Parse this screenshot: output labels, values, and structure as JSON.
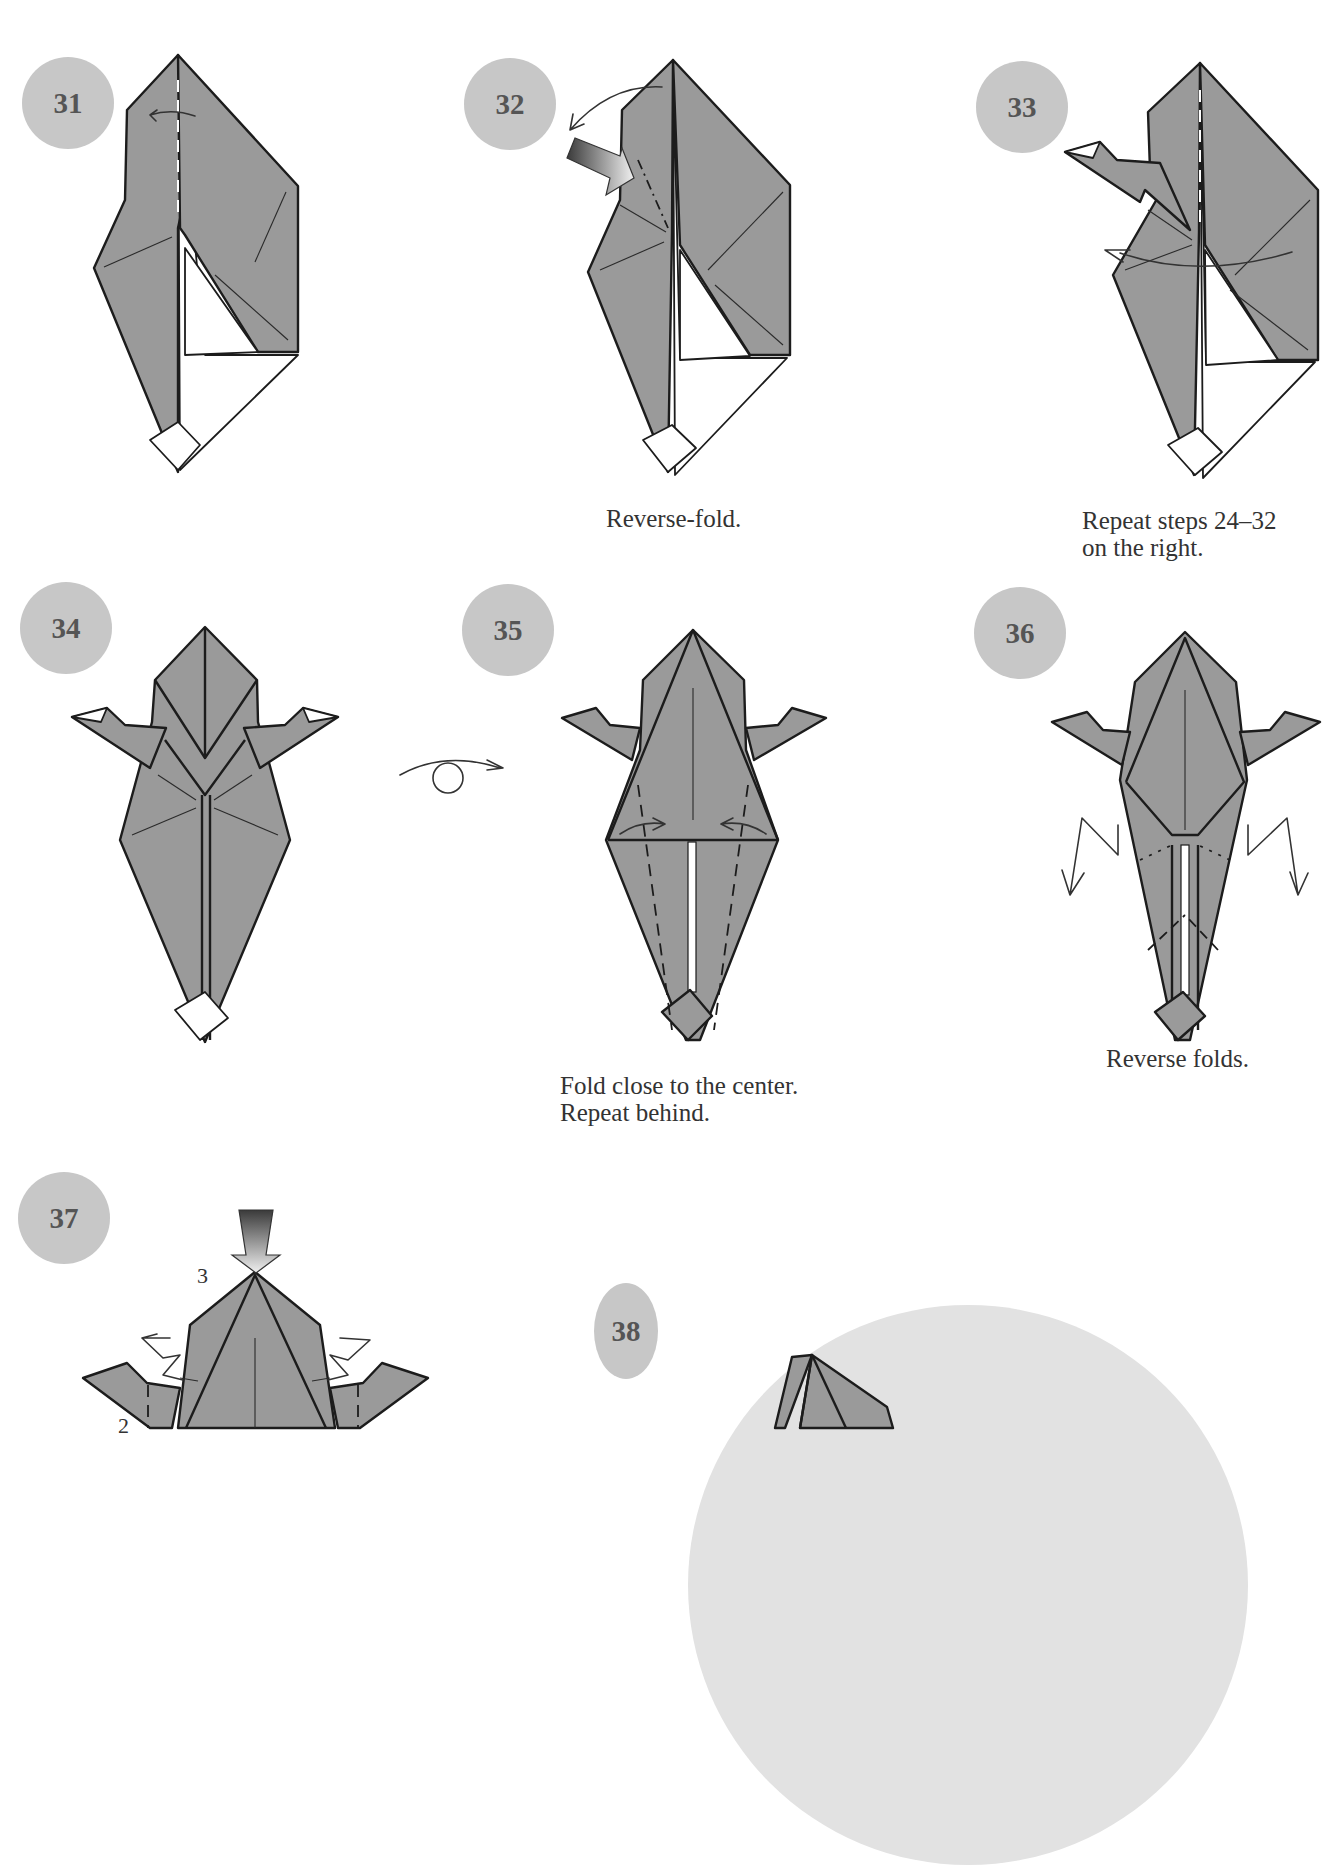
{
  "page": {
    "background": "#ffffff",
    "badge_color": "#c7c7c7",
    "badge_text_color": "#555555",
    "paper_color": "#9a9a9a",
    "outline_color": "#1c1c1c"
  },
  "steps": [
    {
      "number": "31",
      "caption": "",
      "symbols": [
        "fold-arrow-left",
        "valley-fold-line"
      ]
    },
    {
      "number": "32",
      "caption": "Reverse-fold.",
      "symbols": [
        "curved-arrow",
        "push-arrow",
        "mountain-fold-line"
      ]
    },
    {
      "number": "33",
      "caption": "Repeat steps 24–32\non the right.",
      "symbols": [
        "curved-arrow-right"
      ]
    },
    {
      "number": "34",
      "caption": "",
      "symbols": []
    },
    {
      "number": "35",
      "caption": "Fold close to the center.\nRepeat behind.",
      "symbols": [
        "fold-arrow-right",
        "fold-arrow-left",
        "valley-fold-lines"
      ]
    },
    {
      "number": "36",
      "caption": "Reverse folds.",
      "symbols": [
        "reverse-fold-arrow-left",
        "reverse-fold-arrow-right"
      ]
    },
    {
      "number": "37",
      "caption": "",
      "sub_labels": [
        "3",
        "2"
      ],
      "symbols": [
        "push-arrow-down",
        "zigzag-arrow-left",
        "zigzag-arrow-right"
      ]
    },
    {
      "number": "38",
      "caption": "",
      "symbols": []
    }
  ],
  "turnover_symbol": "turn-over-icon"
}
